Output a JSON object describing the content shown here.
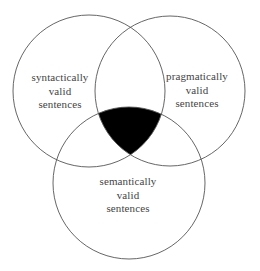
{
  "diagram": {
    "type": "venn",
    "stroke_color": "#555555",
    "intersection_fill": "#000000",
    "background": "#ffffff",
    "sets": [
      {
        "id": "syntactic",
        "lines": [
          "syntactically",
          "valid",
          "sentences"
        ],
        "circle": {
          "cx": 89,
          "cy": 91,
          "r": 76
        }
      },
      {
        "id": "pragmatic",
        "lines": [
          "pragmatically",
          "valid",
          "sentences"
        ],
        "circle": {
          "cx": 170,
          "cy": 91,
          "r": 75
        }
      },
      {
        "id": "semantic",
        "lines": [
          "semantically",
          "valid",
          "sentences"
        ],
        "circle": {
          "cx": 129,
          "cy": 183,
          "r": 76
        }
      }
    ],
    "highlighted_region": "intersection of all three sets"
  }
}
